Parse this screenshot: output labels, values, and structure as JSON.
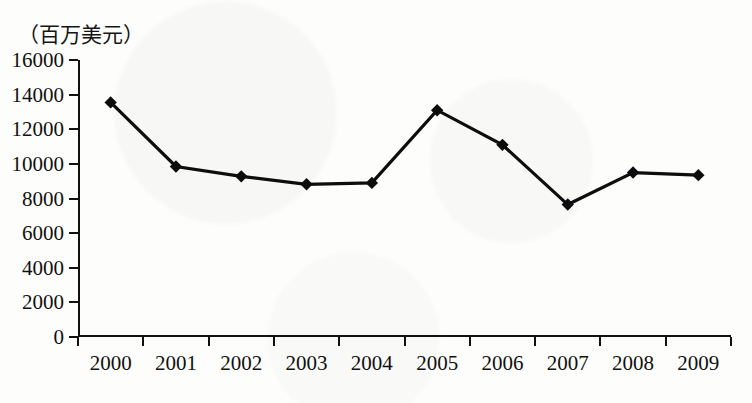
{
  "chart_data": {
    "type": "line",
    "title": "（百万美元）",
    "xlabel": "",
    "ylabel": "",
    "categories": [
      "2000",
      "2001",
      "2002",
      "2003",
      "2004",
      "2005",
      "2006",
      "2007",
      "2008",
      "2009"
    ],
    "series": [
      {
        "name": "",
        "values": [
          13550,
          9850,
          9280,
          8820,
          8900,
          13100,
          11100,
          7650,
          9500,
          9350
        ]
      }
    ],
    "ylim": [
      0,
      16000
    ],
    "ytick_labels": [
      "16000",
      "14000",
      "12000",
      "10000",
      "8000",
      "6000",
      "4000",
      "2000",
      "0"
    ],
    "ytick_values": [
      16000,
      14000,
      12000,
      10000,
      8000,
      6000,
      4000,
      2000,
      0
    ],
    "grid": false,
    "legend": "none",
    "marker": "diamond",
    "line_color": "#0d0d0d",
    "marker_color": "#0d0d0d",
    "background_color": "#fdfdfb"
  }
}
